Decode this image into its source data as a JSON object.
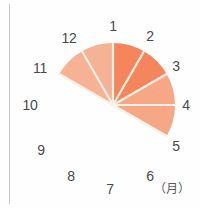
{
  "chart_data": {
    "type": "pie",
    "title": "",
    "subtitle": "",
    "xlabel": "",
    "ylabel": "",
    "unit_label": "（月）",
    "categories": [
      "12",
      "1",
      "2",
      "3",
      "4",
      "5",
      "6",
      "7",
      "8",
      "9",
      "10",
      "11"
    ],
    "values": [
      1,
      1,
      1,
      1,
      1,
      1,
      0,
      0,
      0,
      0,
      0,
      0
    ],
    "sector_span_degrees": 30,
    "filled_count": 6,
    "center": {
      "x": 113,
      "y": 105
    },
    "radius": 62,
    "legend_position": "none",
    "grid": false,
    "sectors": [
      {
        "label": "12",
        "from_hour": 12,
        "to_hour": 1,
        "start_deg": -60,
        "end_deg": -30,
        "color": "#f6b294",
        "filled": true
      },
      {
        "label": "1",
        "from_hour": 1,
        "to_hour": 2,
        "start_deg": -30,
        "end_deg": 0,
        "color": "#f6b294",
        "filled": true
      },
      {
        "label": "2",
        "from_hour": 2,
        "to_hour": 3,
        "start_deg": 0,
        "end_deg": 30,
        "color": "#f4855c",
        "filled": true
      },
      {
        "label": "3",
        "from_hour": 3,
        "to_hour": 4,
        "start_deg": 30,
        "end_deg": 60,
        "color": "#f4855c",
        "filled": true
      },
      {
        "label": "4",
        "from_hour": 4,
        "to_hour": 5,
        "start_deg": 60,
        "end_deg": 90,
        "color": "#f6a886",
        "filled": true
      },
      {
        "label": "5",
        "from_hour": 5,
        "to_hour": 6,
        "start_deg": 90,
        "end_deg": 120,
        "color": "#f6a886",
        "filled": true
      }
    ],
    "tick_labels": [
      {
        "text": "1",
        "x": 113,
        "y": 26
      },
      {
        "text": "2",
        "x": 150,
        "y": 36
      },
      {
        "text": "3",
        "x": 176,
        "y": 66
      },
      {
        "text": "4",
        "x": 186,
        "y": 105
      },
      {
        "text": "5",
        "x": 176,
        "y": 146
      },
      {
        "text": "6",
        "x": 150,
        "y": 176
      },
      {
        "text": "7",
        "x": 110,
        "y": 189
      },
      {
        "text": "8",
        "x": 71,
        "y": 176
      },
      {
        "text": "9",
        "x": 41,
        "y": 150
      },
      {
        "text": "10",
        "x": 30,
        "y": 105
      },
      {
        "text": "11",
        "x": 40,
        "y": 68
      },
      {
        "text": "12",
        "x": 69,
        "y": 38
      }
    ],
    "unit_label_pos": {
      "x": 172,
      "y": 189
    },
    "colors": {
      "light_peach": "#f6b294",
      "mid_peach": "#f6a886",
      "dark_orange": "#f4855c",
      "divider": "#fdf0e4",
      "label_text": "#4a4a4a",
      "axis_rule": "#c9c9c9",
      "background": "#fefefe"
    }
  }
}
